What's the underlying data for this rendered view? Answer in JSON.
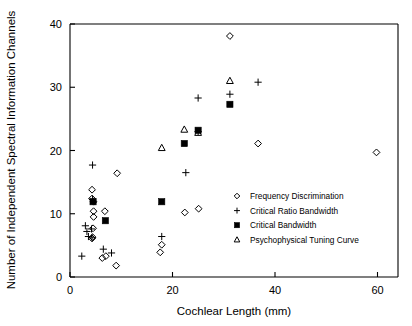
{
  "chart_data": {
    "type": "scatter",
    "title": "",
    "xlabel": "Cochlear Length (mm)",
    "ylabel": "Number of Independent Spectral Information Channels",
    "xlim": [
      0,
      64
    ],
    "ylim": [
      0,
      40
    ],
    "xticks": [
      0,
      20,
      40,
      60
    ],
    "yticks": [
      0,
      10,
      20,
      30,
      40
    ],
    "xtick_labels": [
      "0",
      "20",
      "40",
      "60"
    ],
    "ytick_labels": [
      "0",
      "10",
      "20",
      "30",
      "40"
    ],
    "grid": false,
    "legend_position": "center-right",
    "series": [
      {
        "name": "Frequency Discrimination",
        "marker": "open-diamond",
        "points": [
          [
            4.3,
            13.8
          ],
          [
            4.3,
            12.4
          ],
          [
            4.6,
            11.9
          ],
          [
            4.6,
            10.4
          ],
          [
            4.6,
            9.5
          ],
          [
            4.5,
            7.7
          ],
          [
            4.4,
            6.3
          ],
          [
            4.3,
            6.1
          ],
          [
            6.8,
            10.4
          ],
          [
            6.3,
            3.0
          ],
          [
            7.0,
            3.3
          ],
          [
            9.2,
            16.4
          ],
          [
            9.0,
            1.8
          ],
          [
            17.9,
            5.1
          ],
          [
            17.6,
            3.9
          ],
          [
            22.4,
            10.2
          ],
          [
            25.1,
            10.8
          ],
          [
            31.2,
            38.1
          ],
          [
            36.7,
            21.1
          ],
          [
            59.8,
            19.7
          ]
        ]
      },
      {
        "name": "Critical Ratio Bandwidth",
        "marker": "plus",
        "points": [
          [
            4.4,
            17.7
          ],
          [
            4.4,
            12.3
          ],
          [
            3.0,
            8.1
          ],
          [
            3.3,
            7.2
          ],
          [
            4.2,
            7.6
          ],
          [
            3.6,
            6.4
          ],
          [
            4.3,
            6.2
          ],
          [
            2.3,
            3.3
          ],
          [
            6.5,
            4.4
          ],
          [
            8.1,
            3.8
          ],
          [
            17.9,
            6.4
          ],
          [
            22.6,
            16.5
          ],
          [
            25.0,
            23.0
          ],
          [
            25.0,
            28.3
          ],
          [
            31.2,
            28.9
          ],
          [
            36.7,
            30.8
          ]
        ]
      },
      {
        "name": "Critical Bandwidth",
        "marker": "filled-square",
        "points": [
          [
            4.5,
            11.9
          ],
          [
            6.9,
            8.9
          ],
          [
            17.9,
            11.9
          ],
          [
            22.3,
            21.1
          ],
          [
            25.0,
            23.2
          ],
          [
            31.2,
            27.3
          ]
        ]
      },
      {
        "name": "Psychophysical Tuning Curve",
        "marker": "open-triangle",
        "points": [
          [
            17.9,
            20.4
          ],
          [
            22.3,
            23.3
          ],
          [
            25.0,
            22.8
          ],
          [
            31.2,
            31.0
          ]
        ]
      }
    ]
  },
  "legend": {
    "entries": [
      {
        "label": "Frequency Discrimination",
        "marker": "open-diamond"
      },
      {
        "label": "Critical Ratio Bandwidth",
        "marker": "plus"
      },
      {
        "label": "Critical Bandwidth",
        "marker": "filled-square"
      },
      {
        "label": "Psychophysical Tuning Curve",
        "marker": "open-triangle"
      }
    ]
  },
  "colors": {
    "axis": "#000000",
    "marker": "#000000",
    "background": "#ffffff"
  }
}
